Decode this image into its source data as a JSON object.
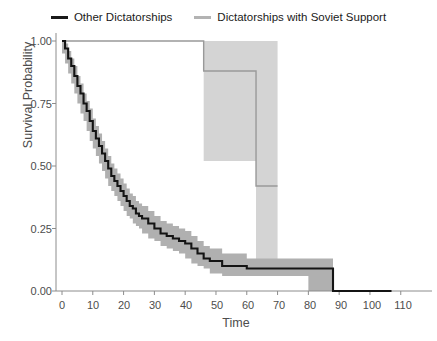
{
  "legend": {
    "position": "top",
    "entries": [
      {
        "label": "Other Dictatorships",
        "color": "#1a1a1a",
        "swatch": "line-swatch-black"
      },
      {
        "label": "Dictatorships with Soviet Support",
        "color": "#b3b3b3",
        "swatch": "line-swatch-gray"
      }
    ]
  },
  "axes": {
    "xlabel": "Time",
    "ylabel": "Survival Probability",
    "xticks": [
      "0",
      "10",
      "20",
      "30",
      "40",
      "50",
      "60",
      "70",
      "80",
      "90",
      "100",
      "110"
    ],
    "yticks": [
      "0.00",
      "0.25",
      "0.50",
      "0.75",
      "1.00"
    ]
  },
  "colors": {
    "series_black": "#1a1a1a",
    "series_gray": "#b3b3b3",
    "band_black": "#b0b0b0",
    "band_gray": "#d4d4d4",
    "axis": "#7f7f7f",
    "text": "#4d4d4d",
    "background": "#ffffff"
  },
  "chart_data": {
    "type": "line",
    "title": "",
    "subtitle": "",
    "xlabel": "Time",
    "ylabel": "Survival Probability",
    "xlim": [
      0,
      113
    ],
    "ylim": [
      0,
      1
    ],
    "grid": false,
    "legend_position": "top",
    "xticks": [
      0,
      10,
      20,
      30,
      40,
      50,
      60,
      70,
      80,
      90,
      100,
      110
    ],
    "yticks": [
      0.0,
      0.25,
      0.5,
      0.75,
      1.0
    ],
    "annotations": [],
    "series": [
      {
        "name": "Other Dictatorships",
        "color": "#1a1a1a",
        "style": "step-post",
        "x": [
          0,
          1,
          2,
          3,
          4,
          5,
          6,
          7,
          8,
          9,
          10,
          11,
          12,
          13,
          14,
          15,
          16,
          17,
          18,
          19,
          20,
          21,
          22,
          23,
          24,
          25,
          26,
          28,
          30,
          32,
          34,
          36,
          38,
          40,
          42,
          44,
          46,
          48,
          52,
          60,
          70,
          80,
          88,
          107
        ],
        "values": [
          1.0,
          0.97,
          0.93,
          0.9,
          0.86,
          0.82,
          0.79,
          0.75,
          0.72,
          0.68,
          0.64,
          0.61,
          0.58,
          0.55,
          0.52,
          0.49,
          0.46,
          0.44,
          0.42,
          0.4,
          0.38,
          0.36,
          0.34,
          0.33,
          0.31,
          0.3,
          0.29,
          0.27,
          0.25,
          0.23,
          0.22,
          0.21,
          0.2,
          0.19,
          0.17,
          0.15,
          0.13,
          0.12,
          0.1,
          0.09,
          0.09,
          0.09,
          0.0,
          0.0
        ],
        "ci_lower": [
          1.0,
          0.95,
          0.91,
          0.87,
          0.83,
          0.79,
          0.75,
          0.71,
          0.68,
          0.64,
          0.6,
          0.57,
          0.54,
          0.51,
          0.48,
          0.45,
          0.42,
          0.4,
          0.38,
          0.36,
          0.34,
          0.32,
          0.3,
          0.29,
          0.27,
          0.26,
          0.25,
          0.23,
          0.21,
          0.2,
          0.18,
          0.17,
          0.16,
          0.15,
          0.13,
          0.11,
          0.1,
          0.09,
          0.07,
          0.06,
          0.06,
          0.06,
          0.0,
          0.0
        ],
        "ci_upper": [
          1.0,
          0.99,
          0.96,
          0.93,
          0.9,
          0.86,
          0.83,
          0.79,
          0.76,
          0.73,
          0.69,
          0.66,
          0.63,
          0.6,
          0.57,
          0.54,
          0.51,
          0.49,
          0.47,
          0.45,
          0.43,
          0.41,
          0.39,
          0.38,
          0.36,
          0.35,
          0.34,
          0.32,
          0.3,
          0.28,
          0.27,
          0.26,
          0.25,
          0.24,
          0.22,
          0.2,
          0.18,
          0.17,
          0.15,
          0.13,
          0.13,
          0.13,
          0.0,
          0.0
        ]
      },
      {
        "name": "Dictatorships with Soviet Support",
        "color": "#b3b3b3",
        "style": "step-post",
        "x": [
          0,
          42,
          46,
          63
        ],
        "values": [
          1.0,
          1.0,
          0.88,
          0.42
        ],
        "ci_lower": [
          1.0,
          1.0,
          0.52,
          0.1
        ],
        "ci_upper": [
          1.0,
          1.0,
          1.0,
          1.0
        ],
        "band_end": 70
      }
    ]
  }
}
